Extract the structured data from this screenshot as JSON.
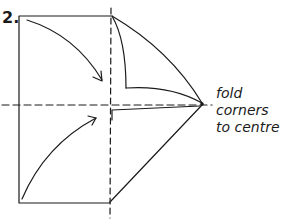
{
  "step": {
    "number": "2."
  },
  "instruction": {
    "lines": [
      "fold",
      "corners",
      "to centre"
    ]
  },
  "colors": {
    "stroke": "#1a1a1a",
    "background": "#ffffff"
  }
}
